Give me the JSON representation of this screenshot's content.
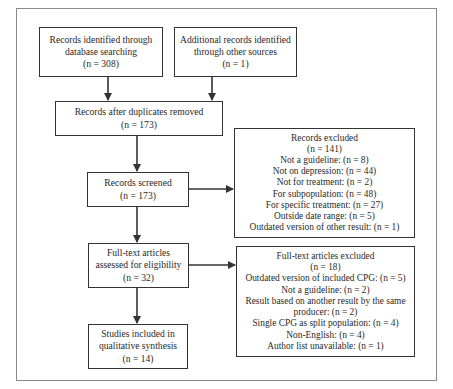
{
  "diagram": {
    "type": "PRISMA flow diagram",
    "boxes": {
      "database": {
        "lines": [
          "Records identified through",
          "database searching",
          "(n = 308)"
        ]
      },
      "other_sources": {
        "lines": [
          "Additional records identified",
          "through other sources",
          "(n = 1)"
        ]
      },
      "after_duplicates": {
        "lines": [
          "Records after duplicates removed",
          "(n = 173)"
        ]
      },
      "screened": {
        "lines": [
          "Records screened",
          "(n = 173)"
        ]
      },
      "records_excluded": {
        "lines": [
          "Records excluded",
          "(n = 141)",
          "Not a guideline: (n = 8)",
          "Not on depression: (n = 44)",
          "Not for treatment: (n = 2)",
          "For subpopulation: (n = 48)",
          "For specific treatment: (n = 27)",
          "Outside date range: (n = 5)",
          "Outdated version of other result: (n = 1)"
        ]
      },
      "full_text_assessed": {
        "lines": [
          "Full-text articles",
          "assessed for eligibility",
          "(n = 32)"
        ]
      },
      "full_text_excluded": {
        "lines": [
          "Full-text articles excluded",
          "(n = 18)",
          "Outdated version of included CPG: (n = 5)",
          "Not a guideline: (n = 2)",
          "Result based on another result by the same",
          "producer: (n = 2)",
          "Single CPG as split population: (n = 4)",
          "Non-English: (n = 4)",
          "Author list unavailable: (n = 1)"
        ]
      },
      "included": {
        "lines": [
          "Studies included in",
          "qualitative synthesis",
          "(n = 14)"
        ]
      }
    },
    "edges": [
      {
        "from": "database",
        "to": "after_duplicates"
      },
      {
        "from": "other_sources",
        "to": "after_duplicates"
      },
      {
        "from": "after_duplicates",
        "to": "screened"
      },
      {
        "from": "screened",
        "to": "records_excluded"
      },
      {
        "from": "screened",
        "to": "full_text_assessed"
      },
      {
        "from": "full_text_assessed",
        "to": "full_text_excluded"
      },
      {
        "from": "full_text_assessed",
        "to": "included"
      }
    ],
    "colors": {
      "stroke": "#333333",
      "frame": "#8a8a8a",
      "text": "#2a2a2a",
      "background": "#ffffff"
    }
  }
}
